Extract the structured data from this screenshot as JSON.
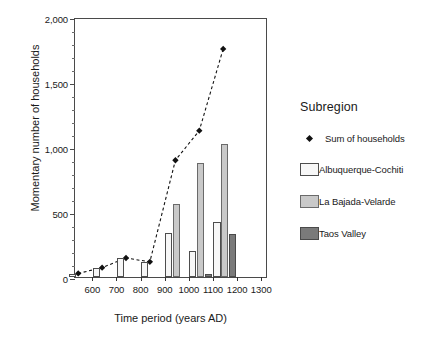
{
  "chart_data": {
    "type": "bar",
    "title": "",
    "xlabel": "Time period (years AD)",
    "ylabel": "Momentary number of households",
    "categories": [
      "600",
      "700",
      "800",
      "900",
      "1000",
      "1100",
      "1200",
      "1300"
    ],
    "xlim": [
      600,
      1300
    ],
    "ylim": [
      0,
      2000
    ],
    "yticks": [
      0,
      500,
      1000,
      1500,
      2000
    ],
    "ytick_labels": [
      "0",
      "500",
      "1,000",
      "1,500",
      "2,000"
    ],
    "yminor_step": 100,
    "grid": false,
    "legend_position": "right",
    "legend_title": "Subregion",
    "series": [
      {
        "name": "Albuquerque-Cochiti",
        "type": "bar",
        "color": "#f7f7f7",
        "edge_color": "#4d4d4d",
        "values": [
          25,
          70,
          145,
          115,
          335,
          200,
          420,
          0
        ]
      },
      {
        "name": "La Bajada-Velarde",
        "type": "bar",
        "color": "#c9c9c9",
        "edge_color": "#6a6a6a",
        "values": [
          0,
          0,
          0,
          0,
          565,
          880,
          1020,
          0
        ]
      },
      {
        "name": "Taos Valley",
        "type": "bar",
        "color": "#7a7a7a",
        "edge_color": "#4a4a4a",
        "values": [
          0,
          0,
          0,
          0,
          0,
          25,
          330,
          0
        ]
      },
      {
        "name": "Sum of households",
        "type": "line",
        "style": "dashed",
        "marker": "diamond",
        "color": "#111111",
        "values": [
          25,
          70,
          145,
          115,
          905,
          1135,
          1770,
          null
        ]
      }
    ]
  },
  "legend": {
    "title": "Subregion",
    "entries": [
      {
        "label": "Sum of households",
        "kind": "marker"
      },
      {
        "label": "Albuquerque-Cochiti",
        "kind": "swatch",
        "series": 0
      },
      {
        "label": "La Bajada-Velarde",
        "kind": "swatch",
        "series": 1
      },
      {
        "label": "Taos Valley",
        "kind": "swatch",
        "series": 2
      }
    ]
  },
  "axes": {
    "x_title": "Time period (years AD)",
    "y_title": "Momentary number of households"
  }
}
